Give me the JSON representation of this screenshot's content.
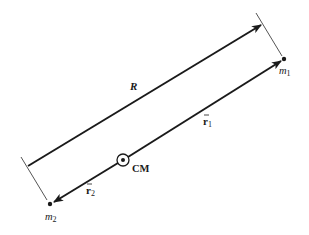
{
  "diagram": {
    "labels": {
      "R": "R",
      "r1": "r",
      "r1_sub": "1",
      "r2": "r",
      "r2_sub": "2",
      "m1": "m",
      "m1_sub": "1",
      "m2": "m",
      "m2_sub": "2",
      "cm": "CM"
    },
    "colors": {
      "line": "#1a1a1a",
      "tick": "#555555",
      "background": "#ffffff"
    }
  }
}
